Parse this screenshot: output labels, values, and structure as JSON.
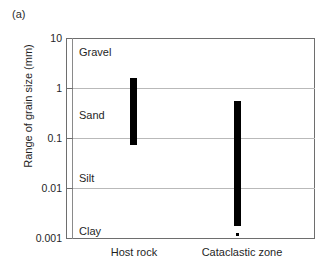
{
  "figure": {
    "panel_label": "(a)"
  },
  "chart_data": {
    "type": "bar",
    "title": "",
    "subtitle": "",
    "xlabel": "",
    "ylabel": "Range of grain size (mm)",
    "yscale": "log",
    "ylim": [
      0.001,
      10
    ],
    "ytick_labels": [
      "10",
      "1",
      "0.1",
      "0.01",
      "0.001"
    ],
    "ytick_values": [
      10,
      1,
      0.1,
      0.01,
      0.001
    ],
    "grid": true,
    "legend": "none",
    "categories": [
      "Host rock",
      "Cataclastic zone"
    ],
    "series": [
      {
        "name": "Range of grain size (mm)",
        "kind": "range-bar",
        "values": [
          {
            "category": "Host rock",
            "min": 0.073,
            "max": 1.6
          },
          {
            "category": "Cataclastic zone",
            "min": 0.0017,
            "max": 0.56
          }
        ]
      }
    ],
    "annotations": [
      {
        "text": "Gravel",
        "kind": "zone-label",
        "y_range": [
          2,
          10
        ]
      },
      {
        "text": "Sand",
        "kind": "zone-label",
        "y_range": [
          0.0625,
          2
        ]
      },
      {
        "text": "Silt",
        "kind": "zone-label",
        "y_range": [
          0.004,
          0.0625
        ]
      },
      {
        "text": "Clay",
        "kind": "zone-label",
        "y_range": [
          0.001,
          0.004
        ]
      },
      {
        "text": "",
        "kind": "outlier-dot",
        "category": "Cataclastic zone",
        "value": 0.0012
      }
    ],
    "colors": {
      "bar": "#000000",
      "grid": "#b9b9b9",
      "frame": "#6e6e6e",
      "text": "#1f1f1f"
    }
  },
  "axis": {
    "y_ticks": [
      {
        "label": "10"
      },
      {
        "label": "1"
      },
      {
        "label": "0.1"
      },
      {
        "label": "0.01"
      },
      {
        "label": "0.001"
      }
    ],
    "y_title": "Range of grain size (mm)",
    "x_categories": [
      {
        "label": "Host rock"
      },
      {
        "label": "Cataclastic zone"
      }
    ]
  },
  "zones": [
    {
      "label": "Gravel"
    },
    {
      "label": "Sand"
    },
    {
      "label": "Silt"
    },
    {
      "label": "Clay"
    }
  ]
}
